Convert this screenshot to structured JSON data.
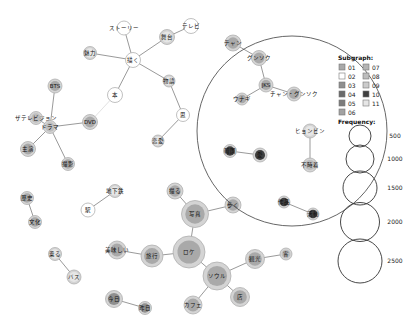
{
  "legend": {
    "subgraph_title": "Subgraph:",
    "subgraph_items": [
      {
        "id": "01",
        "color": "#a9a9a9"
      },
      {
        "id": "02",
        "color": "#ffffff"
      },
      {
        "id": "03",
        "color": "#8f8f8f"
      },
      {
        "id": "04",
        "color": "#6a6a6a"
      },
      {
        "id": "05",
        "color": "#7c7c7c"
      },
      {
        "id": "06",
        "color": "#a2a2a2"
      },
      {
        "id": "07",
        "color": "#b4b4b4"
      },
      {
        "id": "08",
        "color": "#bdbdbd"
      },
      {
        "id": "09",
        "color": "#cbcbcb"
      },
      {
        "id": "10",
        "color": "#3f3f3f"
      },
      {
        "id": "11",
        "color": "#e6e6e6"
      }
    ],
    "frequency_title": "Frequency:",
    "frequency_items": [
      {
        "label": "500",
        "r": 11
      },
      {
        "label": "1000",
        "r": 14
      },
      {
        "label": "1500",
        "r": 17
      },
      {
        "label": "2000",
        "r": 19.5
      },
      {
        "label": "2500",
        "r": 22
      }
    ]
  },
  "nodes": [
    {
      "id": "n1",
      "label": "ストーリー",
      "x": 124,
      "y": 28,
      "r": 7,
      "fill": "#ffffff"
    },
    {
      "id": "n2",
      "label": "テレビ",
      "x": 191,
      "y": 26,
      "r": 7.5,
      "fill": "#ffffff"
    },
    {
      "id": "n3",
      "label": "舞台",
      "x": 167,
      "y": 37,
      "r": 7.5,
      "fill": "#e6e6e6"
    },
    {
      "id": "n4",
      "label": "魅力",
      "x": 90,
      "y": 53,
      "r": 6.5,
      "fill": "#e6e6e6"
    },
    {
      "id": "n5",
      "label": "描く",
      "x": 133,
      "y": 60,
      "r": 7.5,
      "fill": "#ffffff"
    },
    {
      "id": "n6",
      "label": "物語",
      "x": 169,
      "y": 81,
      "r": 6,
      "fill": "#e6e6e6"
    },
    {
      "id": "n7",
      "label": "本",
      "x": 115,
      "y": 95,
      "r": 7.5,
      "fill": "#ffffff"
    },
    {
      "id": "n8",
      "label": "思",
      "x": 183,
      "y": 115,
      "r": 6.5,
      "fill": "#ffffff"
    },
    {
      "id": "n9",
      "label": "恋愛",
      "x": 158,
      "y": 141,
      "r": 6,
      "fill": "#e6e6e6"
    },
    {
      "id": "n10",
      "label": "BTS",
      "x": 55,
      "y": 86,
      "r": 7,
      "fill": "#a9a9a9"
    },
    {
      "id": "n11",
      "label": "ザテレビジョン",
      "x": 36,
      "y": 118,
      "r": 6.5,
      "fill": "#bdbdbd"
    },
    {
      "id": "n12",
      "label": "ドラマ",
      "x": 50,
      "y": 127,
      "r": 6.5,
      "fill": "#bdbdbd"
    },
    {
      "id": "n13",
      "label": "DVD",
      "x": 90,
      "y": 122,
      "r": 7.5,
      "fill": "#a9a9a9"
    },
    {
      "id": "n14",
      "label": "主演",
      "x": 28,
      "y": 149,
      "r": 7.5,
      "fill": "#a9a9a9"
    },
    {
      "id": "n15",
      "label": "撮影",
      "x": 68,
      "y": 164,
      "r": 6.5,
      "fill": "#a9a9a9"
    },
    {
      "id": "n16",
      "label": "チャン",
      "x": 233,
      "y": 43,
      "r": 8,
      "fill": "#a9a9a9"
    },
    {
      "id": "n17",
      "label": "グンソク",
      "x": 259,
      "y": 58,
      "r": 7.5,
      "fill": "#a9a9a9"
    },
    {
      "id": "n18",
      "label": "JKS",
      "x": 266,
      "y": 85,
      "r": 7,
      "fill": "#a9a9a9"
    },
    {
      "id": "n19",
      "label": "ウナギ",
      "x": 242,
      "y": 99,
      "r": 6,
      "fill": "#a9a9a9"
    },
    {
      "id": "n20",
      "label": "チャン・グンソク",
      "x": 294,
      "y": 94,
      "r": 7,
      "fill": "#a9a9a9"
    },
    {
      "id": "n21",
      "label": "ヒョンビン",
      "x": 310,
      "y": 131,
      "r": 7,
      "fill": "#e6e6e6"
    },
    {
      "id": "n22",
      "label": "不時着",
      "x": 310,
      "y": 165,
      "r": 7,
      "fill": "#bdbdbd"
    },
    {
      "id": "n23",
      "label": "韓国",
      "x": 230,
      "y": 151,
      "r": 6.5,
      "fill": "#3f3f3f",
      "dark": true
    },
    {
      "id": "n24",
      "label": "愛",
      "x": 260,
      "y": 155,
      "r": 7,
      "fill": "#3f3f3f",
      "dark": true
    },
    {
      "id": "n25",
      "label": "作品",
      "x": 284,
      "y": 202,
      "r": 6,
      "fill": "#3f3f3f",
      "dark": true
    },
    {
      "id": "n26",
      "label": "活動",
      "x": 313,
      "y": 214,
      "r": 6,
      "fill": "#3f3f3f",
      "dark": true
    },
    {
      "id": "n27",
      "label": "歴史",
      "x": 27,
      "y": 198,
      "r": 6.5,
      "fill": "#a9a9a9"
    },
    {
      "id": "n28",
      "label": "文化",
      "x": 35,
      "y": 222,
      "r": 6.5,
      "fill": "#a9a9a9"
    },
    {
      "id": "n29",
      "label": "地下鉄",
      "x": 115,
      "y": 191,
      "r": 6.5,
      "fill": "#e6e6e6"
    },
    {
      "id": "n30",
      "label": "駅",
      "x": 88,
      "y": 210,
      "r": 7,
      "fill": "#ffffff"
    },
    {
      "id": "n31",
      "label": "乗る",
      "x": 55,
      "y": 254,
      "r": 6.5,
      "fill": "#e6e6e6"
    },
    {
      "id": "n32",
      "label": "バス",
      "x": 74,
      "y": 277,
      "r": 7,
      "fill": "#e6e6e6"
    },
    {
      "id": "n33",
      "label": "撮る",
      "x": 175,
      "y": 191,
      "r": 8,
      "fill": "#a9a9a9"
    },
    {
      "id": "n34",
      "label": "写真",
      "x": 195,
      "y": 214,
      "r": 13.5,
      "fill": "#a9a9a9"
    },
    {
      "id": "n35",
      "label": "歩く",
      "x": 233,
      "y": 205,
      "r": 8,
      "fill": "#a9a9a9"
    },
    {
      "id": "n36",
      "label": "ロケ",
      "x": 189,
      "y": 252,
      "r": 16,
      "fill": "#a9a9a9"
    },
    {
      "id": "n37",
      "label": "美味しい",
      "x": 117,
      "y": 250,
      "r": 9,
      "fill": "#a9a9a9"
    },
    {
      "id": "n38",
      "label": "旅行",
      "x": 152,
      "y": 256,
      "r": 11,
      "fill": "#a9a9a9"
    },
    {
      "id": "n39",
      "label": "ソウル",
      "x": 217,
      "y": 276,
      "r": 14,
      "fill": "#a9a9a9"
    },
    {
      "id": "n40",
      "label": "観光",
      "x": 255,
      "y": 259,
      "r": 9.5,
      "fill": "#a9a9a9"
    },
    {
      "id": "n41",
      "label": "客",
      "x": 286,
      "y": 254,
      "r": 6,
      "fill": "#bdbdbd"
    },
    {
      "id": "n42",
      "label": "店",
      "x": 240,
      "y": 297,
      "r": 9.5,
      "fill": "#a9a9a9"
    },
    {
      "id": "n43",
      "label": "カフェ",
      "x": 193,
      "y": 305,
      "r": 9,
      "fill": "#a9a9a9"
    },
    {
      "id": "n44",
      "label": "今日",
      "x": 114,
      "y": 299,
      "r": 8.5,
      "fill": "#8f8f8f"
    },
    {
      "id": "n45",
      "label": "昨日",
      "x": 145,
      "y": 308,
      "r": 6.5,
      "fill": "#8f8f8f"
    }
  ],
  "edges": [
    [
      "n1",
      "n5"
    ],
    [
      "n2",
      "n3"
    ],
    [
      "n3",
      "n5"
    ],
    [
      "n4",
      "n5"
    ],
    [
      "n5",
      "n6"
    ],
    [
      "n5",
      "n7"
    ],
    [
      "n6",
      "n8"
    ],
    [
      "n8",
      "n9"
    ],
    [
      "n10",
      "n12"
    ],
    [
      "n11",
      "n12"
    ],
    [
      "n12",
      "n13"
    ],
    [
      "n12",
      "n14"
    ],
    [
      "n12",
      "n15"
    ],
    [
      "n16",
      "n17"
    ],
    [
      "n17",
      "n18"
    ],
    [
      "n18",
      "n19"
    ],
    [
      "n18",
      "n20"
    ],
    [
      "n21",
      "n22"
    ],
    [
      "n23",
      "n24"
    ],
    [
      "n25",
      "n26"
    ],
    [
      "n27",
      "n28"
    ],
    [
      "n29",
      "n30"
    ],
    [
      "n31",
      "n32"
    ],
    [
      "n33",
      "n34"
    ],
    [
      "n34",
      "n35"
    ],
    [
      "n34",
      "n36"
    ],
    [
      "n36",
      "n38"
    ],
    [
      "n37",
      "n38"
    ],
    [
      "n36",
      "n39"
    ],
    [
      "n39",
      "n40"
    ],
    [
      "n40",
      "n41"
    ],
    [
      "n39",
      "n42"
    ],
    [
      "n39",
      "n43"
    ],
    [
      "n44",
      "n45"
    ]
  ],
  "faint_edges": [
    [
      "n7",
      "n13"
    ]
  ],
  "highlight_circle": {
    "cx": 292,
    "cy": 131,
    "r": 95
  }
}
